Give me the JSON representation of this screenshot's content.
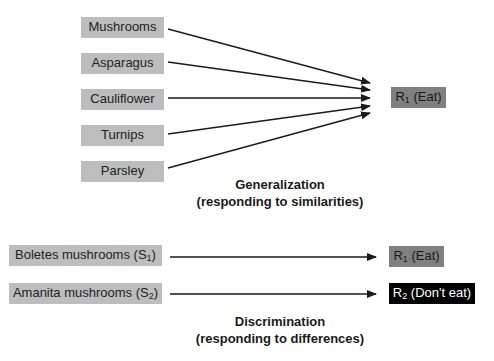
{
  "generalization": {
    "stimuli": [
      {
        "label": "Mushrooms"
      },
      {
        "label": "Asparagus"
      },
      {
        "label": "Cauliflower"
      },
      {
        "label": "Turnips"
      },
      {
        "label": "Parsley"
      }
    ],
    "response": {
      "prefix": "R",
      "sub": "1",
      "suffix": " (Eat)"
    },
    "caption": {
      "title": "Generalization",
      "subtitle": "(responding to similarities)"
    }
  },
  "discrimination": {
    "pairs": [
      {
        "stimulus": {
          "prefix": "Boletes mushrooms (S",
          "sub": "1",
          "suffix": ")"
        },
        "response": {
          "prefix": "R",
          "sub": "1",
          "suffix": " (Eat)"
        }
      },
      {
        "stimulus": {
          "prefix": "Amanita mushrooms (S",
          "sub": "2",
          "suffix": ")"
        },
        "response": {
          "prefix": "R",
          "sub": "2",
          "suffix": " (Don't eat)"
        }
      }
    ],
    "caption": {
      "title": "Discrimination",
      "subtitle": "(responding to differences)"
    }
  },
  "colors": {
    "stimulus_box": "#bdbdbd",
    "response_eat": "#808080",
    "response_dont_eat": "#000000",
    "arrow": "#1a1a1a"
  }
}
